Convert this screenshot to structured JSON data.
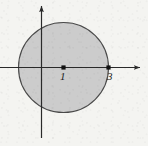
{
  "figure": {
    "name": "shaded-disk-on-axes",
    "background_color": "#f4f4f1",
    "axis_color": "#2a2a2a",
    "disk_fill_color": "#c9c9c9",
    "disk_stroke_color": "#4a4a4a",
    "point_color": "#111111",
    "width": 148,
    "height": 146
  },
  "axes": {
    "x_axis": {
      "name": "x-axis",
      "origin_px": {
        "x": 41.5,
        "y": 67.5
      },
      "start_px": {
        "x": 0,
        "y": 67.5
      },
      "end_px": {
        "x": 142,
        "y": 67.5
      },
      "has_arrowhead": true,
      "arrow_direction": "right"
    },
    "y_axis": {
      "name": "y-axis",
      "start_px": {
        "x": 41.5,
        "y": 138
      },
      "end_px": {
        "x": 41.5,
        "y": 4
      },
      "has_arrowhead": true,
      "arrow_direction": "up"
    }
  },
  "disk": {
    "center_px": {
      "x": 63.5,
      "y": 67.5
    },
    "radius_px": 45,
    "center_value": 1,
    "radius_value": 2,
    "filled": true
  },
  "points": [
    {
      "name": "center-point",
      "label": "1",
      "value": 1,
      "px": {
        "x": 63.5,
        "y": 67.5
      }
    },
    {
      "name": "right-intercept-point",
      "label": "3",
      "value": 3,
      "px": {
        "x": 108.5,
        "y": 67.5
      }
    }
  ],
  "labels": {
    "center": "1",
    "right": "3"
  }
}
